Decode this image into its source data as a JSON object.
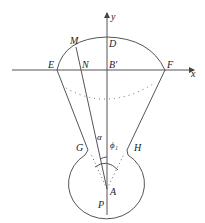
{
  "diagram": {
    "labels": {
      "y_axis": "y",
      "x_axis": "x",
      "M": "M",
      "D": "D",
      "E": "E",
      "N": "N",
      "B": "B′",
      "F": "F",
      "G": "G",
      "H": "H",
      "alpha": "α",
      "phi": "ϕ₁",
      "A": "A",
      "P": "P"
    },
    "colors": {
      "line": "#555555",
      "dots": "#666666",
      "text": "#222222"
    }
  }
}
